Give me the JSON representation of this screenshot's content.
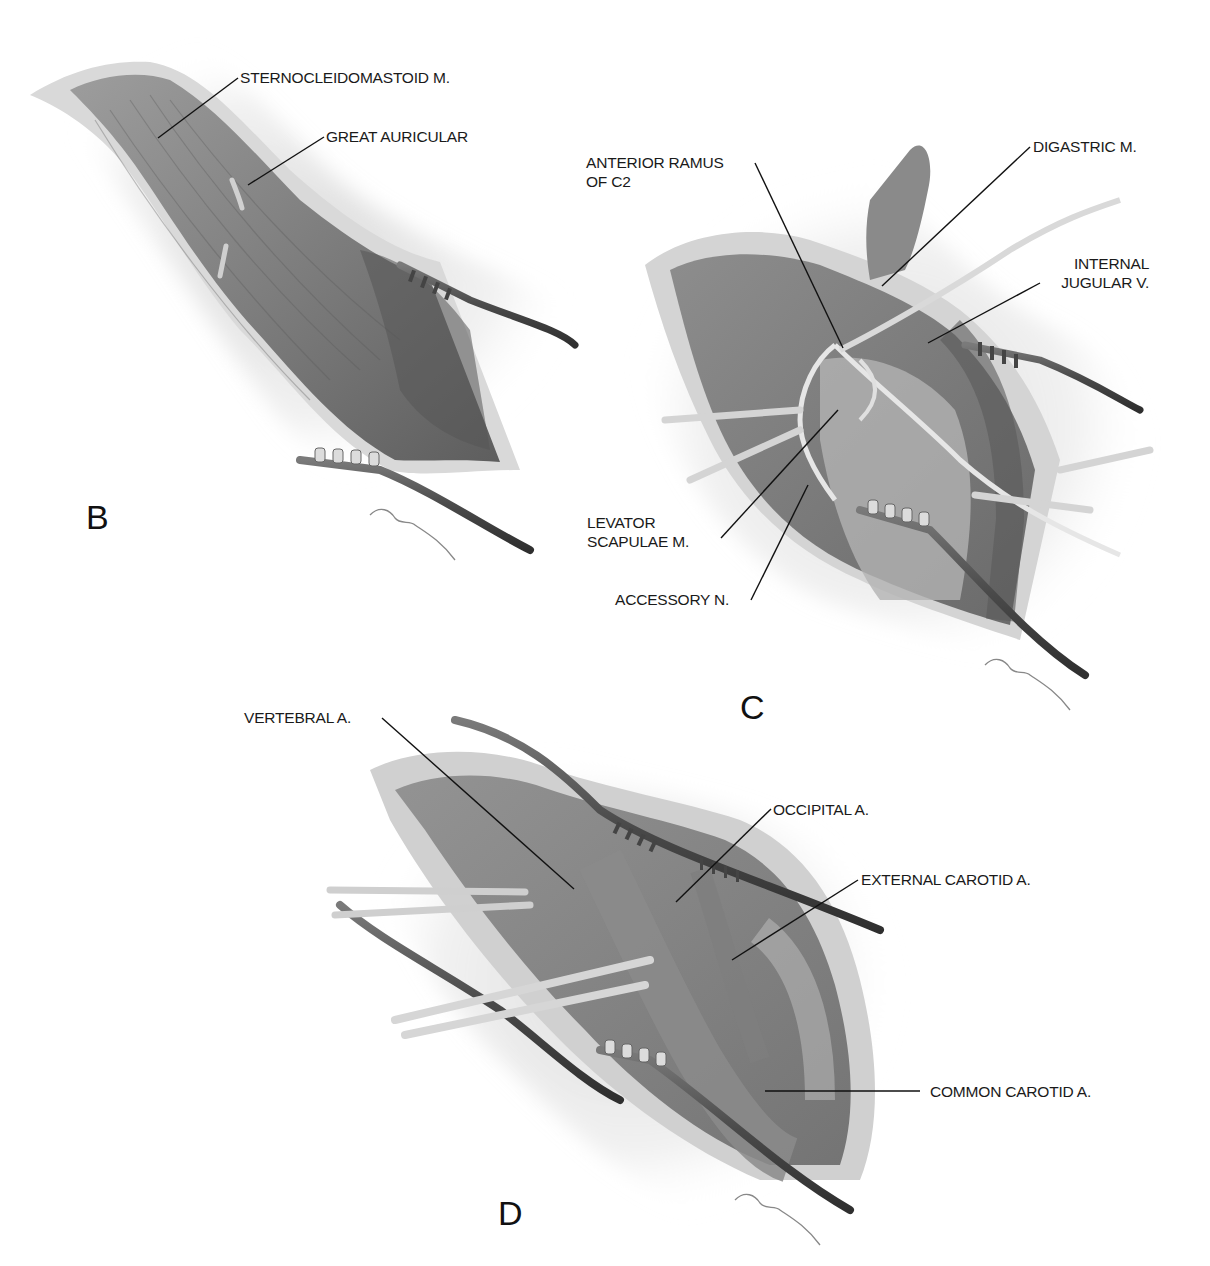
{
  "figure": {
    "panels": [
      {
        "id": "B",
        "letter": "B",
        "labels": [
          {
            "text": "STERNOCLEIDOMASTOID M."
          },
          {
            "text": "GREAT AURICULAR"
          }
        ],
        "signature": "C Wellman"
      },
      {
        "id": "C",
        "letter": "C",
        "labels": [
          {
            "text": "ANTERIOR RAMUS",
            "text2": "OF C2"
          },
          {
            "text": "DIGASTRIC M."
          },
          {
            "text": "INTERNAL",
            "text2": "JUGULAR V."
          },
          {
            "text": "LEVATOR",
            "text2": "SCAPULAE M."
          },
          {
            "text": "ACCESSORY N."
          }
        ],
        "signature": "C Wellman"
      },
      {
        "id": "D",
        "letter": "D",
        "labels": [
          {
            "text": "VERTEBRAL A."
          },
          {
            "text": "OCCIPITAL A."
          },
          {
            "text": "EXTERNAL CAROTID A."
          },
          {
            "text": "COMMON CAROTID A."
          }
        ],
        "signature": "C Wellman"
      }
    ],
    "colors": {
      "background": "#ffffff",
      "tissue_dark": "#6f6f6f",
      "tissue_mid": "#9a9a9a",
      "tissue_light": "#c9c9c9",
      "skin_edge": "#e4e4e4",
      "retractor": "#5a5a5a",
      "leader_line": "#111111"
    }
  }
}
